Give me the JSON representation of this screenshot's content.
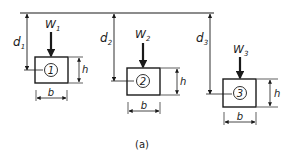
{
  "diagram": {
    "caption": "(a)",
    "reference_line": "surface",
    "colors": {
      "ink": "#1a1a1a",
      "background": "#ffffff"
    },
    "blocks": [
      {
        "id": "1",
        "number": "1",
        "load_label": "W",
        "load_sub": "1",
        "depth_label": "d",
        "depth_sub": "1",
        "height_label": "h",
        "width_label": "b"
      },
      {
        "id": "2",
        "number": "2",
        "load_label": "W",
        "load_sub": "2",
        "depth_label": "d",
        "depth_sub": "2",
        "height_label": "h",
        "width_label": "b"
      },
      {
        "id": "3",
        "number": "3",
        "load_label": "W",
        "load_sub": "3",
        "depth_label": "d",
        "depth_sub": "3",
        "height_label": "h",
        "width_label": "b"
      }
    ]
  }
}
